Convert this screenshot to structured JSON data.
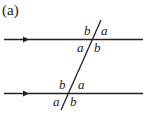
{
  "figure": {
    "label": "(a)",
    "angles_top": {
      "upper_left": "b",
      "upper_right": "a",
      "lower_left": "a",
      "lower_right": "b"
    },
    "angles_bottom": {
      "upper_left": "b",
      "upper_right": "a",
      "lower_left": "a",
      "lower_right": "b"
    }
  }
}
